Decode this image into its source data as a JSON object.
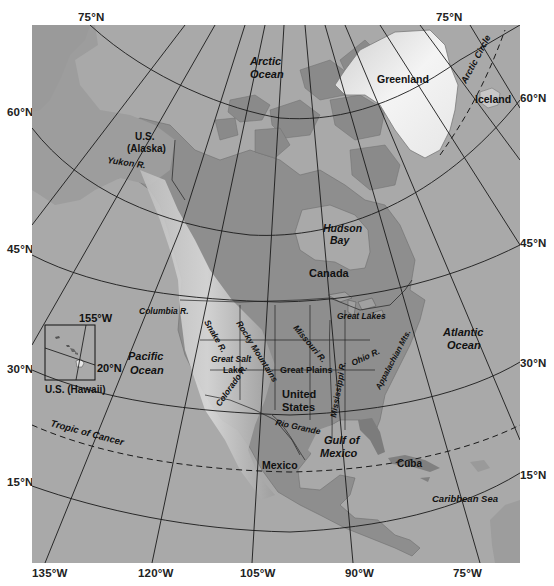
{
  "map": {
    "title": "North America",
    "ocean_color": "#a9a9a9",
    "land_color": "#8f8f8f",
    "highland_color": "#d4d4d4",
    "graticule_color": "#1a1a1a"
  },
  "axis_labels": {
    "top_left_lat": "75°N",
    "top_right_lat": "75°N",
    "left": [
      "60°N",
      "45°N",
      "30°N",
      "15°N"
    ],
    "right": [
      "60°N",
      "45°N",
      "30°N",
      "15°N"
    ],
    "bottom": [
      "135°W",
      "120°W",
      "105°W",
      "90°W",
      "75°W"
    ]
  },
  "oceans": {
    "arctic": [
      "Arctic",
      "Ocean"
    ],
    "pacific": [
      "Pacific",
      "Ocean"
    ],
    "atlantic": [
      "Atlantic",
      "Ocean"
    ],
    "gulf": [
      "Gulf of",
      "Mexico"
    ],
    "caribbean": "Caribbean Sea",
    "hudson": [
      "Hudson",
      "Bay"
    ]
  },
  "countries": {
    "greenland": "Greenland",
    "iceland": "Iceland",
    "alaska": [
      "U.S.",
      "(Alaska)"
    ],
    "canada": "Canada",
    "usa": [
      "United",
      "States"
    ],
    "mexico": "Mexico",
    "cuba": "Cuba"
  },
  "features": {
    "yukon": "Yukon R.",
    "columbia": "Columbia R.",
    "snake": "Snake R.",
    "rocky": "Rocky Mountains",
    "great_salt_lake": [
      "Great Salt",
      "Lake"
    ],
    "colorado": "Colorado R.",
    "great_plains": "Great Plains",
    "missouri": "Missouri R.",
    "mississippi": "Mississippi R.",
    "ohio": "Ohio R.",
    "great_lakes": "Great Lakes",
    "appalachian": "Appalachian Mts.",
    "rio_grande": "Rio Grande",
    "arctic_circle": "Arctic Circle",
    "tropic_of_cancer": "Tropic of Cancer"
  },
  "inset": {
    "label": "U.S. (Hawaii)",
    "lon_label": "155°W",
    "lat_label": "20°N"
  }
}
